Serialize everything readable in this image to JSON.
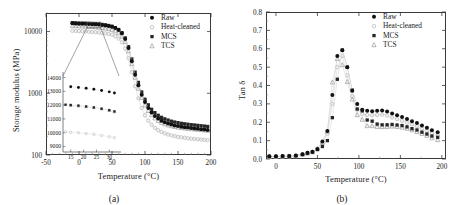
{
  "figure": {
    "panel_a_caption": "(a)",
    "panel_b_caption": "(b)"
  },
  "chart_data": [
    {
      "id": "panel-a",
      "type": "scatter",
      "title": "",
      "xlabel": "Temperature (°C)",
      "ylabel": "Storage modulus (MPa)",
      "xlim": [
        -50,
        200
      ],
      "ylim": [
        100,
        20000
      ],
      "yscale": "log",
      "xticks": [
        -50,
        0,
        50,
        100,
        150,
        200
      ],
      "xticklabels": [
        "-50",
        "0",
        "50",
        "100",
        "150",
        "200"
      ],
      "yticks": [
        100,
        1000,
        10000
      ],
      "yticklabels": [
        "100",
        "1000",
        "10000"
      ],
      "grid": false,
      "legend_position": "upper right",
      "legend": [
        "Raw",
        "Heat-cleaned",
        "MCS",
        "TCS"
      ],
      "series": [
        {
          "name": "Raw",
          "marker": "filled-circle",
          "color": "#111111",
          "x": [
            -10,
            -5,
            0,
            5,
            10,
            15,
            20,
            25,
            30,
            35,
            40,
            45,
            50,
            55,
            60,
            65,
            70,
            75,
            80,
            85,
            90,
            95,
            100,
            105,
            110,
            115,
            120,
            125,
            130,
            135,
            140,
            145,
            150,
            155,
            160,
            165,
            170,
            175,
            180,
            185,
            190,
            195
          ],
          "y": [
            13600,
            13500,
            13450,
            13400,
            13350,
            13300,
            13200,
            13100,
            13000,
            12800,
            12600,
            12300,
            12000,
            11400,
            10600,
            9400,
            7600,
            5400,
            3300,
            2000,
            1350,
            950,
            720,
            580,
            490,
            430,
            390,
            360,
            340,
            325,
            312,
            302,
            295,
            288,
            282,
            278,
            274,
            270,
            266,
            262,
            258,
            255
          ]
        },
        {
          "name": "Heat-cleaned",
          "marker": "open-circle-light",
          "color": "#b5b5b5",
          "x": [
            -10,
            -5,
            0,
            5,
            10,
            15,
            20,
            25,
            30,
            35,
            40,
            45,
            50,
            55,
            60,
            65,
            70,
            75,
            80,
            85,
            90,
            95,
            100,
            105,
            110,
            115,
            120,
            125,
            130,
            135,
            140,
            145,
            150,
            155,
            160,
            165,
            170,
            175,
            180,
            185,
            190,
            195
          ],
          "y": [
            10300,
            10250,
            10200,
            10150,
            10050,
            9950,
            9850,
            9750,
            9650,
            9500,
            9350,
            9150,
            8900,
            8400,
            7700,
            6700,
            5300,
            3700,
            2200,
            1300,
            830,
            580,
            440,
            360,
            310,
            275,
            252,
            236,
            224,
            215,
            208,
            202,
            197,
            193,
            190,
            187,
            184,
            182,
            180,
            178,
            176,
            174
          ]
        },
        {
          "name": "MCS",
          "marker": "filled-square",
          "color": "#1c1c1c",
          "x": [
            -10,
            -5,
            0,
            5,
            10,
            15,
            20,
            25,
            30,
            35,
            40,
            45,
            50,
            55,
            60,
            65,
            70,
            75,
            80,
            85,
            90,
            95,
            100,
            105,
            110,
            115,
            120,
            125,
            130,
            135,
            140,
            145,
            150,
            155,
            160,
            165,
            170,
            175,
            180,
            185,
            190,
            195
          ],
          "y": [
            13900,
            13800,
            13750,
            13700,
            13650,
            13600,
            13500,
            13400,
            13250,
            13050,
            12850,
            12550,
            12200,
            11600,
            10800,
            9600,
            7900,
            5700,
            3600,
            2200,
            1500,
            1050,
            800,
            650,
            550,
            485,
            440,
            408,
            385,
            368,
            353,
            342,
            334,
            326,
            320,
            315,
            310,
            306,
            302,
            298,
            294,
            290
          ]
        },
        {
          "name": "TCS",
          "marker": "open-triangle-light",
          "color": "#aaaaaa",
          "x": [
            -10,
            -5,
            0,
            5,
            10,
            15,
            20,
            25,
            30,
            35,
            40,
            45,
            50,
            55,
            60,
            65,
            70,
            75,
            80,
            85,
            90,
            95,
            100,
            105,
            110,
            115,
            120,
            125,
            130,
            135,
            140,
            145,
            150,
            155,
            160,
            165,
            170,
            175,
            180,
            185,
            190,
            195
          ],
          "y": [
            12400,
            12350,
            12300,
            12250,
            12150,
            12050,
            11950,
            11850,
            11700,
            11500,
            11300,
            11050,
            10750,
            10200,
            9450,
            8350,
            6800,
            4800,
            3000,
            1800,
            1200,
            850,
            640,
            520,
            445,
            395,
            360,
            336,
            318,
            305,
            295,
            287,
            281,
            276,
            272,
            268,
            265,
            262,
            259,
            256,
            253,
            250
          ]
        }
      ],
      "inset": {
        "xlim": [
          12,
          33
        ],
        "ylim": [
          8600,
          14400
        ],
        "xticks": [
          15,
          20,
          25,
          30
        ],
        "xticklabels": [
          "15",
          "20",
          "25",
          "30"
        ],
        "yticks": [
          9000,
          10000,
          11000,
          12000,
          13000,
          14000
        ],
        "yticklabels": [
          "9000",
          "10000",
          "11000",
          "12000",
          "13000",
          "14000"
        ],
        "source_box": {
          "x0": 12,
          "x1": 33,
          "y0": 11500,
          "y1": 14200
        },
        "series": [
          {
            "name": "Raw",
            "marker": "filled-circle",
            "color": "#111111",
            "x": [
              15,
              18,
              21,
              24,
              27,
              30,
              32
            ],
            "y": [
              13330,
              13280,
              13220,
              13150,
              13060,
              12960,
              12880
            ]
          },
          {
            "name": "MCS",
            "marker": "filled-square",
            "color": "#1c1c1c",
            "x": [
              13,
              15,
              18,
              21,
              24,
              27,
              30,
              32
            ],
            "y": [
              12030,
              12000,
              11960,
              11900,
              11830,
              11740,
              11630,
              11540
            ]
          },
          {
            "name": "TCS",
            "marker": "open-triangle-light",
            "color": "#aaaaaa",
            "x": [
              15,
              18,
              21,
              24,
              27,
              30,
              32
            ],
            "y": [
              11990,
              11950,
              11890,
              11820,
              11730,
              11620,
              11530
            ]
          },
          {
            "name": "Heat-cleaned",
            "marker": "open-circle-light",
            "color": "#c0c0c0",
            "x": [
              13,
              15,
              18,
              21,
              24,
              27,
              30,
              32
            ],
            "y": [
              10060,
              10030,
              9990,
              9940,
              9880,
              9800,
              9710,
              9640
            ]
          }
        ]
      }
    },
    {
      "id": "panel-b",
      "type": "scatter",
      "title": "",
      "xlabel": "Temperature (°C)",
      "ylabel": "Tan δ",
      "xlim": [
        -12,
        205
      ],
      "ylim": [
        0.0,
        0.8
      ],
      "yscale": "linear",
      "xticks": [
        0,
        50,
        100,
        150,
        200
      ],
      "xticklabels": [
        "0",
        "50",
        "100",
        "150",
        "200"
      ],
      "yticks": [
        0.0,
        0.1,
        0.2,
        0.3,
        0.4,
        0.5,
        0.6,
        0.7,
        0.8
      ],
      "yticklabels": [
        "0.0",
        "0.1",
        "0.2",
        "0.3",
        "0.4",
        "0.5",
        "0.6",
        "0.7",
        "0.8"
      ],
      "grid": false,
      "legend_position": "upper right",
      "legend": [
        "Raw",
        "Heat-cleaned",
        "MCS",
        "TCS"
      ],
      "series": [
        {
          "name": "Raw",
          "marker": "filled-circle",
          "color": "#111111",
          "x": [
            -8,
            0,
            8,
            16,
            24,
            32,
            38,
            44,
            50,
            56,
            62,
            68,
            74,
            80,
            86,
            92,
            98,
            104,
            110,
            116,
            122,
            128,
            134,
            140,
            146,
            152,
            158,
            164,
            170,
            176,
            182,
            188,
            195
          ],
          "y": [
            0.015,
            0.015,
            0.016,
            0.017,
            0.019,
            0.026,
            0.034,
            0.04,
            0.055,
            0.095,
            0.152,
            0.348,
            0.56,
            0.592,
            0.5,
            0.372,
            0.3,
            0.268,
            0.262,
            0.26,
            0.262,
            0.264,
            0.258,
            0.247,
            0.238,
            0.228,
            0.218,
            0.206,
            0.196,
            0.182,
            0.17,
            0.156,
            0.145
          ]
        },
        {
          "name": "Heat-cleaned",
          "marker": "open-circle-light",
          "color": "#c3c3c3",
          "x": [
            -8,
            0,
            8,
            16,
            24,
            32,
            38,
            44,
            50,
            56,
            62,
            68,
            74,
            80,
            86,
            92,
            98,
            104,
            110,
            116,
            122,
            128,
            134,
            140,
            146,
            152,
            158,
            164,
            170,
            176,
            182,
            188,
            195
          ],
          "y": [
            0.013,
            0.013,
            0.014,
            0.015,
            0.017,
            0.024,
            0.03,
            0.037,
            0.052,
            0.085,
            0.138,
            0.3,
            0.5,
            0.56,
            0.455,
            0.34,
            0.268,
            0.244,
            0.24,
            0.238,
            0.24,
            0.242,
            0.236,
            0.226,
            0.217,
            0.208,
            0.198,
            0.188,
            0.178,
            0.166,
            0.154,
            0.14,
            0.13
          ]
        },
        {
          "name": "MCS",
          "marker": "filled-square",
          "color": "#1c1c1c",
          "x": [
            -8,
            0,
            8,
            16,
            24,
            32,
            38,
            44,
            50,
            56,
            62,
            68,
            74,
            80,
            86,
            92,
            98,
            104,
            110,
            116,
            122,
            128,
            134,
            140,
            146,
            152,
            158,
            164,
            170,
            176,
            182,
            188,
            195
          ],
          "y": [
            0.014,
            0.014,
            0.015,
            0.016,
            0.018,
            0.025,
            0.032,
            0.038,
            0.052,
            0.068,
            0.1,
            0.225,
            0.434,
            0.593,
            0.5,
            0.375,
            0.272,
            0.262,
            0.212,
            0.206,
            0.19,
            0.186,
            0.186,
            0.188,
            0.185,
            0.182,
            0.175,
            0.165,
            0.158,
            0.146,
            0.136,
            0.125,
            0.118
          ]
        },
        {
          "name": "TCS",
          "marker": "open-triangle-light",
          "color": "#aaaaaa",
          "x": [
            -8,
            0,
            8,
            16,
            24,
            32,
            38,
            44,
            50,
            56,
            62,
            68,
            74,
            80,
            86,
            92,
            98,
            104,
            110,
            116,
            122,
            128,
            134,
            140,
            146,
            152,
            158,
            164,
            170,
            176,
            182,
            188,
            195
          ],
          "y": [
            0.013,
            0.013,
            0.014,
            0.015,
            0.017,
            0.024,
            0.031,
            0.038,
            0.055,
            0.09,
            0.15,
            0.418,
            0.545,
            0.512,
            0.42,
            0.325,
            0.24,
            0.215,
            0.18,
            0.18,
            0.176,
            0.175,
            0.176,
            0.178,
            0.176,
            0.172,
            0.166,
            0.158,
            0.148,
            0.138,
            0.128,
            0.114,
            0.104
          ]
        }
      ]
    }
  ]
}
